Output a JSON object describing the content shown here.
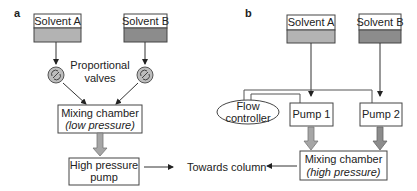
{
  "panel_a": {
    "label": "a",
    "solvent_a": "Solvent A",
    "solvent_b": "Solvent B",
    "valves_label_line1": "Proportional",
    "valves_label_line2": "valves",
    "mixing_line1": "Mixing chamber",
    "mixing_line2": "(low pressure)",
    "pump_line1": "High pressure",
    "pump_line2": "pump"
  },
  "panel_b": {
    "label": "b",
    "solvent_a": "Solvent A",
    "solvent_b": "Solvent B",
    "flow_line1": "Flow",
    "flow_line2": "controller",
    "pump1": "Pump 1",
    "pump2": "Pump 2",
    "mixing_line1": "Mixing chamber",
    "mixing_line2": "(high pressure)"
  },
  "center": {
    "towards_column": "Towards column"
  },
  "colors": {
    "solvent_a_fill": "#b3b3b3",
    "solvent_b_fill": "#8c8c8c",
    "arrow_fill": "#a6a6a6",
    "line": "#333333"
  }
}
